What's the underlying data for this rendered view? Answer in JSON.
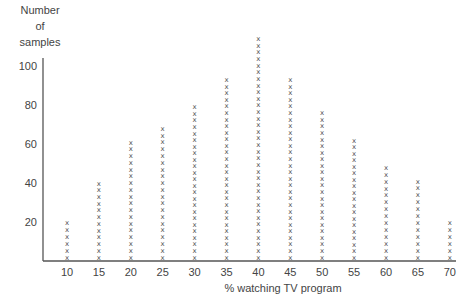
{
  "chart_data": {
    "type": "scatter",
    "style": "dot-plot (stacked x markers)",
    "title": "",
    "ylabel_lines": [
      "Number",
      "of",
      "samples"
    ],
    "xlabel": "% watching TV program",
    "x_ticks": [
      10,
      15,
      20,
      25,
      30,
      35,
      40,
      45,
      50,
      55,
      60,
      65,
      70
    ],
    "y_ticks": [
      20,
      40,
      60,
      80,
      100
    ],
    "ylim": [
      0,
      115
    ],
    "xlim": [
      7,
      71
    ],
    "marker_symbol": "x",
    "samples_per_marker": 3.33,
    "x": [
      10,
      15,
      20,
      25,
      30,
      35,
      40,
      45,
      50,
      55,
      60,
      65,
      70
    ],
    "values": [
      20,
      40,
      61,
      68,
      79,
      93,
      114,
      93,
      76,
      62,
      48,
      41,
      20
    ],
    "grid": false,
    "legend": "none"
  }
}
